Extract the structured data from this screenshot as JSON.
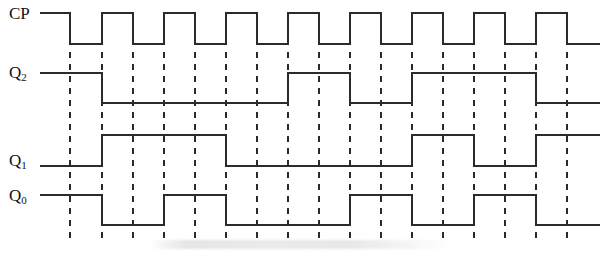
{
  "figure": {
    "type": "timing-diagram",
    "width": 606,
    "height": 255,
    "background_color": "#ffffff",
    "line_color": "#2b2b2b",
    "dash_color": "#2b2b2b"
  },
  "labels": {
    "cp": "CP",
    "q2_base": "Q",
    "q2_sub": "2",
    "q1_base": "Q",
    "q1_sub": "1",
    "q0_base": "Q",
    "q0_sub": "0"
  },
  "chart_data": {
    "type": "line",
    "xlabel": "",
    "ylabel": "",
    "grid": true,
    "legend_position": "left",
    "x_unit_px": 31,
    "x_origin_px": 40,
    "x_end_px": 600,
    "half_period_px": 31,
    "clock_period_px": 62,
    "dashed_gridlines_px": [
      70,
      102,
      133,
      164,
      195,
      226,
      257,
      288,
      319,
      350,
      381,
      412,
      443,
      474,
      505,
      536,
      567
    ],
    "dash_top_px": 52,
    "dash_bottom_px": 238,
    "series": [
      {
        "name": "CP",
        "label": "CP",
        "high_y_px": 13,
        "low_y_px": 44,
        "start_level": 1,
        "transitions_px": [
          70,
          102,
          133,
          164,
          195,
          226,
          257,
          288,
          319,
          350,
          381,
          412,
          443,
          474,
          505,
          536,
          567
        ],
        "levels": [
          1,
          0,
          1,
          0,
          1,
          0,
          1,
          0,
          1,
          0,
          1,
          0,
          1,
          0,
          1,
          0,
          1,
          0
        ],
        "description": "Clock, starts high, 17 edges, ends low"
      },
      {
        "name": "Q2",
        "label": "Q2",
        "high_y_px": 73,
        "low_y_px": 103,
        "start_level": 1,
        "transitions_px": [
          102,
          288,
          350,
          412,
          536
        ],
        "levels": [
          1,
          0,
          1,
          0,
          1,
          0
        ],
        "description": "MSB of counter"
      },
      {
        "name": "Q1",
        "label": "Q1",
        "high_y_px": 135,
        "low_y_px": 166,
        "start_level": 0,
        "transitions_px": [
          102,
          226,
          412,
          474,
          536
        ],
        "levels": [
          0,
          1,
          0,
          1,
          0,
          1
        ],
        "description": "Middle bit of counter"
      },
      {
        "name": "Q0",
        "label": "Q0",
        "high_y_px": 195,
        "low_y_px": 225,
        "start_level": 1,
        "transitions_px": [
          102,
          164,
          226,
          350,
          412,
          474,
          536
        ],
        "levels": [
          1,
          0,
          1,
          0,
          1,
          0,
          1,
          0
        ],
        "description": "LSB of counter"
      }
    ]
  }
}
